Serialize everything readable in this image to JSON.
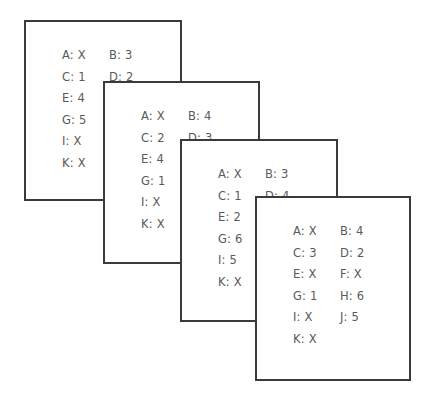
{
  "cards": [
    {
      "rect": {
        "left": 24,
        "top": 20,
        "width": 158,
        "height": 181
      },
      "text_origin": {
        "x": 36,
        "y": 27
      },
      "entries": [
        {
          "label": "A: X",
          "col": 0,
          "row": 0
        },
        {
          "label": "B: 3",
          "col": 1,
          "row": 0
        },
        {
          "label": "C: 1",
          "col": 0,
          "row": 1
        },
        {
          "label": "D: 2",
          "col": 1,
          "row": 1
        },
        {
          "label": "E: 4",
          "col": 0,
          "row": 2
        },
        {
          "label": "G: 5",
          "col": 0,
          "row": 3
        },
        {
          "label": "I:  X",
          "col": 0,
          "row": 4
        },
        {
          "label": "K: X",
          "col": 0,
          "row": 5
        }
      ]
    },
    {
      "rect": {
        "left": 103,
        "top": 81,
        "width": 157,
        "height": 183
      },
      "text_origin": {
        "x": 36,
        "y": 27
      },
      "entries": [
        {
          "label": "A: X",
          "col": 0,
          "row": 0
        },
        {
          "label": "B: 4",
          "col": 1,
          "row": 0
        },
        {
          "label": "C: 2",
          "col": 0,
          "row": 1
        },
        {
          "label": "D: 3",
          "col": 1,
          "row": 1
        },
        {
          "label": "E: 4",
          "col": 0,
          "row": 2
        },
        {
          "label": "G: 1",
          "col": 0,
          "row": 3
        },
        {
          "label": "I:  X",
          "col": 0,
          "row": 4
        },
        {
          "label": "K: X",
          "col": 0,
          "row": 5
        }
      ]
    },
    {
      "rect": {
        "left": 180,
        "top": 139,
        "width": 158,
        "height": 183
      },
      "text_origin": {
        "x": 36,
        "y": 27
      },
      "entries": [
        {
          "label": "A: X",
          "col": 0,
          "row": 0
        },
        {
          "label": "B: 3",
          "col": 1,
          "row": 0
        },
        {
          "label": "C: 1",
          "col": 0,
          "row": 1
        },
        {
          "label": "D: 4",
          "col": 1,
          "row": 1
        },
        {
          "label": "E: 2",
          "col": 0,
          "row": 2
        },
        {
          "label": "G: 6",
          "col": 0,
          "row": 3
        },
        {
          "label": "I: 5",
          "col": 0,
          "row": 4
        },
        {
          "label": "K: X",
          "col": 0,
          "row": 5
        }
      ]
    },
    {
      "rect": {
        "left": 255,
        "top": 196,
        "width": 156,
        "height": 185
      },
      "text_origin": {
        "x": 36,
        "y": 27
      },
      "entries": [
        {
          "label": "A: X",
          "col": 0,
          "row": 0
        },
        {
          "label": "B: 4",
          "col": 1,
          "row": 0
        },
        {
          "label": "C: 3",
          "col": 0,
          "row": 1
        },
        {
          "label": "D: 2",
          "col": 1,
          "row": 1
        },
        {
          "label": "E: X",
          "col": 0,
          "row": 2
        },
        {
          "label": "F: X",
          "col": 1,
          "row": 2
        },
        {
          "label": "G: 1",
          "col": 0,
          "row": 3
        },
        {
          "label": "H: 6",
          "col": 1,
          "row": 3
        },
        {
          "label": "I: X",
          "col": 0,
          "row": 4
        },
        {
          "label": "J: 5",
          "col": 1,
          "row": 4
        },
        {
          "label": "K: X",
          "col": 0,
          "row": 5
        }
      ]
    }
  ],
  "layout": {
    "col_spacing": 47,
    "row_spacing": 21.6
  }
}
